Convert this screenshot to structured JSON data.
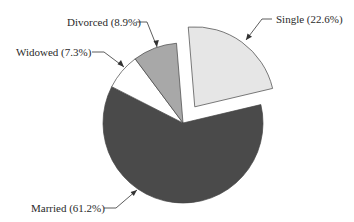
{
  "chart_data": {
    "type": "pie",
    "title": "",
    "categories": [
      "Married",
      "Single",
      "Divorced",
      "Widowed"
    ],
    "values": [
      61.2,
      22.6,
      8.9,
      7.3
    ],
    "unit": "%",
    "labels": [
      "Married (61.2%)",
      "Single (22.6%)",
      "Divorced (8.9%)",
      "Widowed (7.3%)"
    ],
    "colors": [
      "#4a4a4a",
      "#e6e6e6",
      "#a8a8a8",
      "#ffffff"
    ],
    "exploded": [
      "Single"
    ],
    "legend": "none (leader-line labels)"
  },
  "labels": {
    "married": "Married (61.2%)",
    "single": "Single (22.6%)",
    "divorced": "Divorced (8.9%)",
    "widowed": "Widowed (7.3%)"
  }
}
